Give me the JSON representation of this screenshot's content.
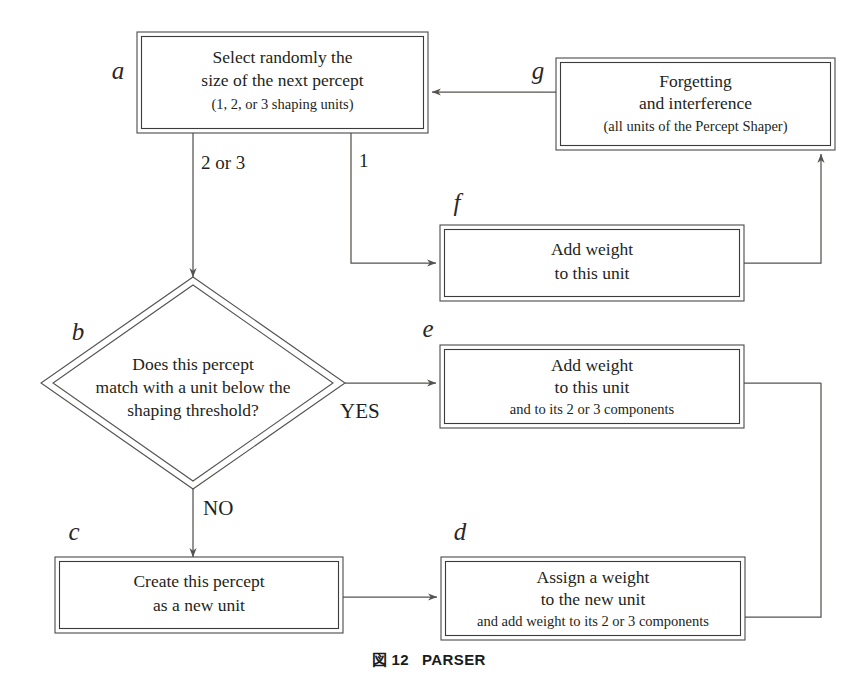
{
  "figure": {
    "caption_prefix": "図",
    "caption_number": "12",
    "caption_title": "PARSER"
  },
  "colors": {
    "stroke": "#56524f",
    "text": "#231f20",
    "background": "#ffffff"
  },
  "nodes": {
    "a": {
      "tag": "a",
      "shape": "process",
      "line1": "Select randomly the",
      "line2": "size of the next percept",
      "line3": "(1, 2, or 3 shaping units)"
    },
    "b": {
      "tag": "b",
      "shape": "decision",
      "line1": "Does this percept",
      "line2": "match with a unit below the",
      "line3": "shaping threshold?"
    },
    "c": {
      "tag": "c",
      "shape": "process",
      "line1": "Create this percept",
      "line2": "as a new unit"
    },
    "d": {
      "tag": "d",
      "shape": "process",
      "line1": "Assign a weight",
      "line2": "to the new unit",
      "line3": "and add weight to its 2 or 3 components"
    },
    "e": {
      "tag": "e",
      "shape": "process",
      "line1": "Add weight",
      "line2": "to this unit",
      "line3": "and to its 2 or 3 components"
    },
    "f": {
      "tag": "f",
      "shape": "process",
      "line1": "Add weight",
      "line2": "to this unit"
    },
    "g": {
      "tag": "g",
      "shape": "process",
      "line1": "Forgetting",
      "line2": "and interference",
      "line3": "(all units of the Percept Shaper)"
    }
  },
  "edge_labels": {
    "a_to_b": "2 or 3",
    "a_to_f": "1",
    "b_yes": "YES",
    "b_no": "NO"
  }
}
